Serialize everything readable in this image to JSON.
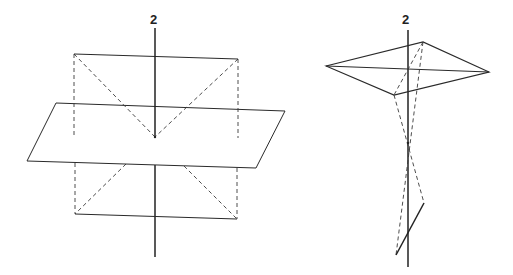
{
  "figures": [
    {
      "id": "left",
      "description": "2-fold rotation axis perpendicular to a mirror plane, with square (top and bottom) and dashed projections",
      "axis_label": "2"
    },
    {
      "id": "right",
      "description": "2-fold rotation axis with a rhombus and twisted dashed projections through a point on the axis",
      "axis_label": "2"
    }
  ],
  "colors": {
    "line": "#2a2a2a",
    "background": "#ffffff"
  }
}
